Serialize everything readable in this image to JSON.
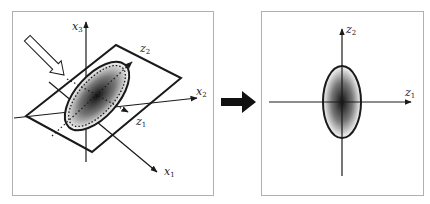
{
  "figure": {
    "left_panel": {
      "description": "3D data distribution on a tilted plane with original axes",
      "axes": {
        "x1": {
          "base": "x",
          "sub": "1"
        },
        "x2": {
          "base": "x",
          "sub": "2"
        },
        "x3": {
          "base": "x",
          "sub": "3"
        }
      },
      "plane_axes": {
        "z1": {
          "base": "z",
          "sub": "1"
        },
        "z2": {
          "base": "z",
          "sub": "2"
        }
      },
      "viewing_arrow": "hollow-arrow"
    },
    "transition_arrow": "solid-right-arrow",
    "right_panel": {
      "description": "2D projection onto principal axes",
      "axes": {
        "z1": {
          "base": "z",
          "sub": "1"
        },
        "z2": {
          "base": "z",
          "sub": "2"
        }
      }
    },
    "colors": {
      "stroke": "#1a1a1a",
      "frame": "#b0b0b0",
      "gradient_center": "#111111",
      "gradient_edge": "#ffffff"
    }
  }
}
